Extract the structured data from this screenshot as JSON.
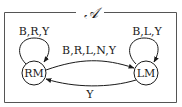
{
  "diagram": {
    "title": "𝒜",
    "states": [
      {
        "id": "RM",
        "label": "RM"
      },
      {
        "id": "LM",
        "label": "LM"
      }
    ],
    "transitions": [
      {
        "from": "RM",
        "to": "RM",
        "label": "B,R,Y"
      },
      {
        "from": "LM",
        "to": "LM",
        "label": "B,L,Y"
      },
      {
        "from": "RM",
        "to": "LM",
        "label": "B,R,L,N,Y"
      },
      {
        "from": "LM",
        "to": "RM",
        "label": "Y"
      }
    ],
    "colors": {
      "stroke": "#1a1a1a",
      "background": "#ffffff"
    }
  }
}
